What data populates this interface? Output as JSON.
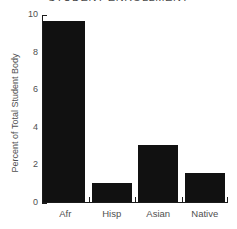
{
  "chart_data": {
    "type": "bar",
    "title": "STUDENT ENROLLMENT",
    "xlabel": "",
    "ylabel": "Percent of Total Student Body",
    "categories": [
      "Afr",
      "Hisp",
      "Asian",
      "Native"
    ],
    "values": [
      9.6,
      1.0,
      3.0,
      1.5
    ],
    "ylim": [
      0,
      10
    ],
    "yticks": [
      0,
      2,
      4,
      6,
      8,
      10
    ],
    "ytick_labels": [
      "0",
      "2",
      "4",
      "6",
      "8",
      "10"
    ],
    "grid": false,
    "legend": false,
    "bar_color": "#111111",
    "axis_color": "#1b1b1b",
    "text_color": "#4f4f4f"
  }
}
